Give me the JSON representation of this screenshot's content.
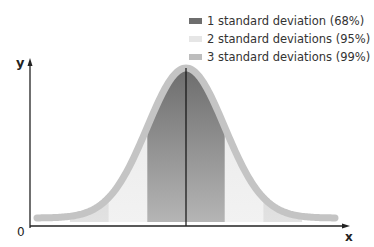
{
  "chart_data": {
    "type": "area",
    "title": "",
    "xlabel": "x",
    "ylabel": "y",
    "origin_label": "0",
    "mean": 0,
    "sd": 1,
    "xlim": [
      -4.0,
      4.3
    ],
    "bands": [
      {
        "name": "1 standard deviation (68%)",
        "range": [
          -1,
          1
        ],
        "color": "#6e6e6e"
      },
      {
        "name": "2 standard deviations (95%)",
        "range": [
          -2,
          2
        ],
        "color": "#e6e6e6"
      },
      {
        "name": "3 standard deviations (99%)",
        "range": [
          -3,
          3
        ],
        "color": "#bdbdbd"
      }
    ],
    "mean_line": true,
    "legend_position": "top-right",
    "grid": false
  }
}
